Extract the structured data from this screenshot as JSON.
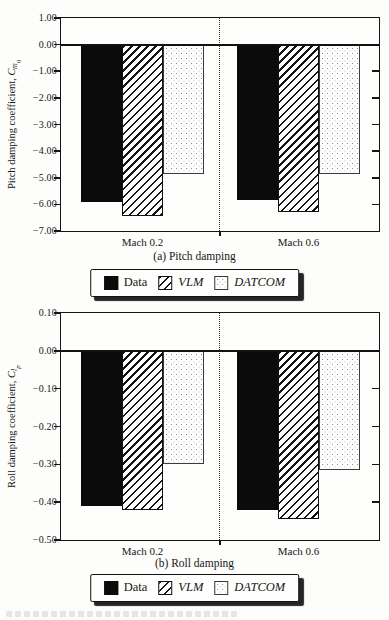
{
  "legend": {
    "items": [
      {
        "label": "Data",
        "pattern": "solid"
      },
      {
        "label": "VLM",
        "pattern": "hatch"
      },
      {
        "label": "DATCOM",
        "pattern": "dots"
      }
    ]
  },
  "chart_data": [
    {
      "type": "bar",
      "panel": "(a)",
      "title": "(a) Pitch damping",
      "ylabel": {
        "prefix": "Pitch damping coefficient, ",
        "symbol": "C",
        "sub": "m",
        "subsub": "q"
      },
      "categories": [
        "Mach 0.2",
        "Mach 0.6"
      ],
      "series": [
        {
          "name": "Data",
          "pattern": "solid",
          "values": [
            -5.9,
            -5.85
          ]
        },
        {
          "name": "VLM",
          "pattern": "hatch",
          "values": [
            -6.45,
            -6.3
          ]
        },
        {
          "name": "DATCOM",
          "pattern": "dots",
          "values": [
            -4.85,
            -4.85
          ]
        }
      ],
      "ylim": [
        -7.0,
        1.0
      ],
      "yticks": [
        1.0,
        0.0,
        -1.0,
        -2.0,
        -3.0,
        -4.0,
        -5.0,
        -6.0,
        -7.0
      ],
      "ytick_labels": [
        "1.00",
        "0.00",
        "−1.00",
        "−2.00",
        "−3.00",
        "−4.00",
        "−5.00",
        "−6.00",
        "−7.00"
      ],
      "grid": false,
      "legend_position": "below"
    },
    {
      "type": "bar",
      "panel": "(b)",
      "title": "(b) Roll damping",
      "ylabel": {
        "prefix": "Roll damping coefficient, ",
        "symbol": "C",
        "sub": "l",
        "subsub": "p"
      },
      "categories": [
        "Mach 0.2",
        "Mach 0.6"
      ],
      "series": [
        {
          "name": "Data",
          "pattern": "solid",
          "values": [
            -0.41,
            -0.42
          ]
        },
        {
          "name": "VLM",
          "pattern": "hatch",
          "values": [
            -0.42,
            -0.445
          ]
        },
        {
          "name": "DATCOM",
          "pattern": "dots",
          "values": [
            -0.3,
            -0.315
          ]
        }
      ],
      "ylim": [
        -0.5,
        0.1
      ],
      "yticks": [
        0.1,
        0.0,
        -0.1,
        -0.2,
        -0.3,
        -0.4,
        -0.5
      ],
      "ytick_labels": [
        "0.10",
        "0.00",
        "−0.10",
        "−0.20",
        "−0.30",
        "−0.40",
        "−0.50"
      ],
      "grid": false,
      "legend_position": "below"
    }
  ]
}
